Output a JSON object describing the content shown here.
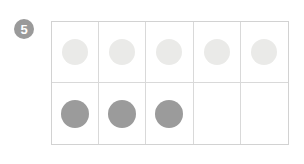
{
  "colors": {
    "background": "#ffffff",
    "grid_line": "#d9d9d9",
    "grid_outer_border": "#d2d2d2",
    "faded_dot": "#eaeae8",
    "filled_dot": "#9b9b9b",
    "badge_background": "#9a9a9a",
    "badge_text": "#ffffff"
  },
  "badge": {
    "label": "5"
  },
  "ten_frame": {
    "columns": 5,
    "rows": 2,
    "faded_dot_count": 5,
    "filled_dot_count": 3,
    "empty_cell_count": 2,
    "rows_data": [
      {
        "name": "top-row",
        "style": "faded",
        "dots": [
          true,
          true,
          true,
          true,
          true
        ]
      },
      {
        "name": "bottom-row",
        "style": "filled",
        "dots": [
          true,
          true,
          true,
          false,
          false
        ]
      }
    ]
  }
}
